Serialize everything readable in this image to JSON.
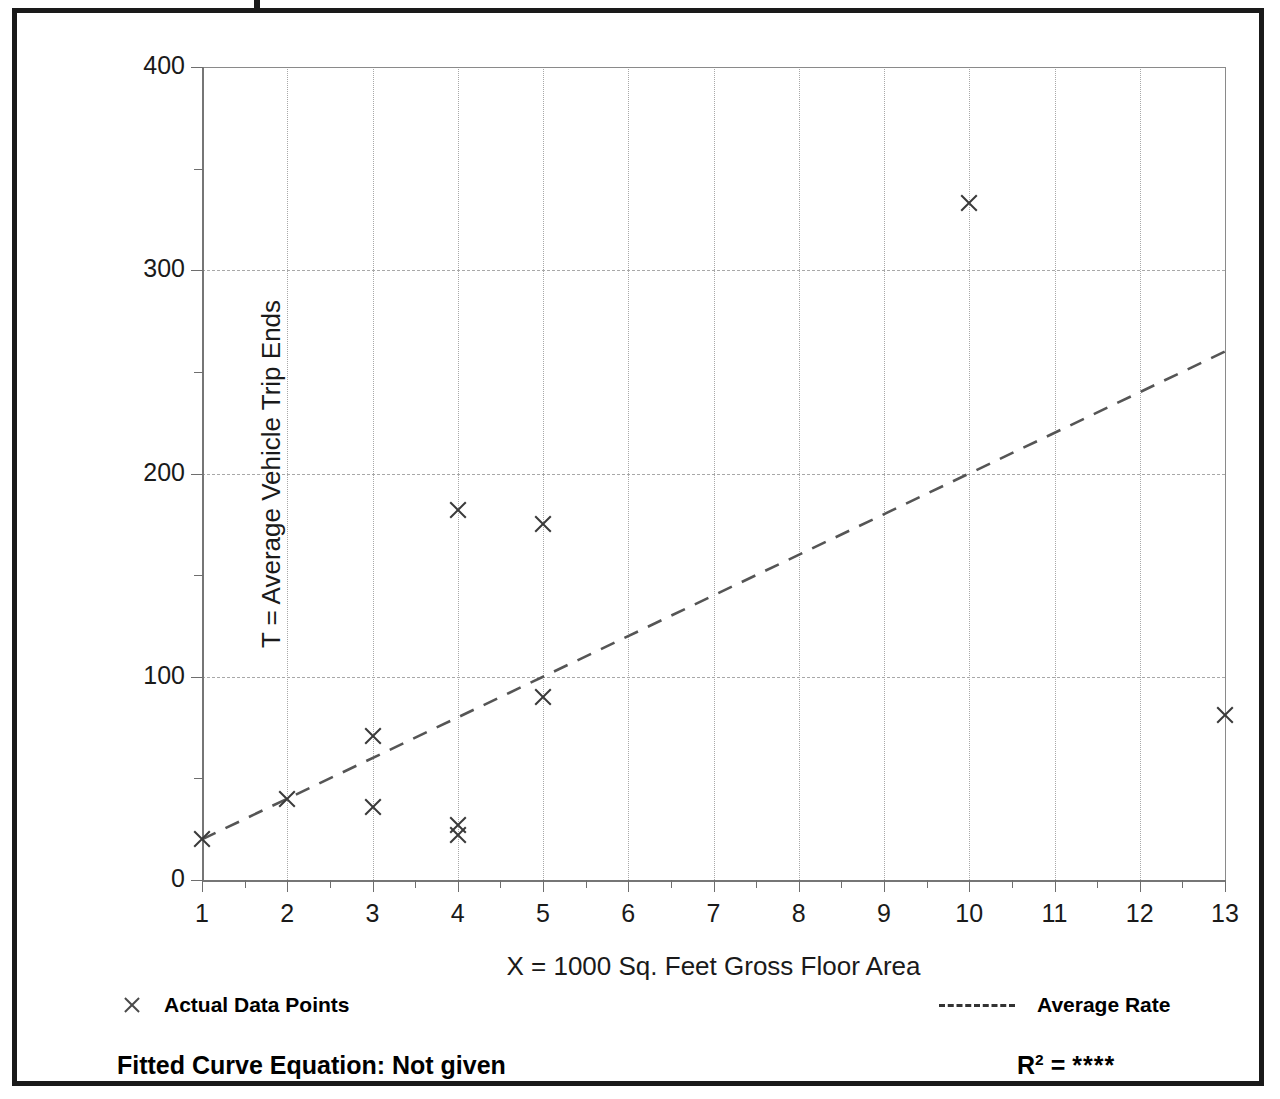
{
  "chart_data": {
    "type": "scatter",
    "title": "",
    "xlabel": "X = 1000 Sq. Feet Gross Floor Area",
    "ylabel": "T = Average Vehicle Trip Ends",
    "xlim": [
      1,
      13
    ],
    "ylim": [
      0,
      400
    ],
    "xticks": [
      1,
      2,
      3,
      4,
      5,
      6,
      7,
      8,
      9,
      10,
      11,
      12,
      13
    ],
    "xtick_labels": [
      "1",
      "2",
      "3",
      "4",
      "5",
      "6",
      "7",
      "8",
      "9",
      "10",
      "11",
      "12",
      "13"
    ],
    "yticks": [
      0,
      100,
      200,
      300,
      400
    ],
    "ytick_labels": [
      "0",
      "100",
      "200",
      "300",
      "400"
    ],
    "yticks_minor": [
      50,
      150,
      250,
      350
    ],
    "grid": {
      "vertical": "dotted",
      "horizontal": "dashed",
      "h_lines": [
        100,
        200,
        300
      ]
    },
    "series": [
      {
        "name": "Actual Data Points",
        "type": "scatter",
        "marker": "x",
        "points": [
          {
            "x": 1,
            "y": 20
          },
          {
            "x": 2,
            "y": 40
          },
          {
            "x": 3,
            "y": 71
          },
          {
            "x": 3,
            "y": 36
          },
          {
            "x": 4,
            "y": 182
          },
          {
            "x": 4,
            "y": 27
          },
          {
            "x": 4,
            "y": 22
          },
          {
            "x": 5,
            "y": 175
          },
          {
            "x": 5,
            "y": 90
          },
          {
            "x": 10,
            "y": 333
          },
          {
            "x": 13,
            "y": 81
          }
        ]
      },
      {
        "name": "Average Rate",
        "type": "line",
        "style": "dashed",
        "endpoints": [
          {
            "x": 1,
            "y": 20
          },
          {
            "x": 13,
            "y": 260
          }
        ]
      }
    ],
    "legend": [
      {
        "label": "Actual Data Points",
        "marker": "x",
        "position": "bottom-left"
      },
      {
        "label": "Average Rate",
        "marker": "dashed-line",
        "position": "bottom-right"
      }
    ],
    "annotations": {
      "fitted_curve_equation_label": "Fitted Curve Equation:",
      "fitted_curve_equation_value": "Not given",
      "r_squared_label": "R",
      "r_squared_exponent": "2",
      "r_squared_equals": "=",
      "r_squared_value": "****"
    }
  },
  "colors": {
    "marker": "#3a3a3a",
    "trend_line": "#555555",
    "grid": "#a8a8a8",
    "axis": "#767676",
    "frame": "#1a1a1a",
    "text": "#000000"
  },
  "footer": {
    "fitted_equation_text": "Fitted Curve Equation:  Not given"
  }
}
